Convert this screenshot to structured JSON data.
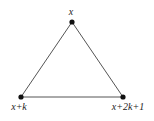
{
  "diagram": {
    "type": "triangle-graph",
    "nodes": [
      {
        "id": "top",
        "label": "x",
        "cx": 72,
        "cy": 22,
        "lx": 71,
        "ly": 15,
        "anchor": "middle"
      },
      {
        "id": "bottom-left",
        "label": "x+k",
        "cx": 21,
        "cy": 97,
        "lx": 19,
        "ly": 110,
        "anchor": "middle"
      },
      {
        "id": "bottom-right",
        "label": "x+2k+1",
        "cx": 123,
        "cy": 97,
        "lx": 128,
        "ly": 110,
        "anchor": "middle"
      }
    ],
    "edges": [
      [
        "top",
        "bottom-left"
      ],
      [
        "top",
        "bottom-right"
      ],
      [
        "bottom-left",
        "bottom-right"
      ]
    ],
    "colors": {
      "edge": "#555555",
      "node": "#111111",
      "text": "#222222"
    }
  }
}
